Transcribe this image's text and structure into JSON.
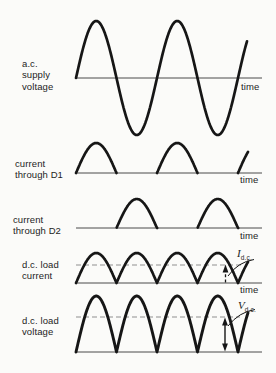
{
  "figure": {
    "colors": {
      "background": "#fbfbf9",
      "waveform": "#161616",
      "axis": "#4a4a4a",
      "dashed_line": "#8f8f8f",
      "text": "#1d1d1d"
    },
    "panels": [
      {
        "id": "ac-supply-voltage",
        "label_lines": [
          "a.c.",
          "supply",
          "voltage"
        ],
        "waveform": "sine",
        "time_label": "time"
      },
      {
        "id": "current-through-d1",
        "label_lines": [
          "current",
          "through D1"
        ],
        "waveform": "half-wave-rectified-positive-half-cycles",
        "time_label": "time"
      },
      {
        "id": "current-through-d2",
        "label_lines": [
          "current",
          "through D2"
        ],
        "waveform": "half-wave-rectified-negative-half-cycles",
        "time_label": "time"
      },
      {
        "id": "dc-load-current",
        "label_lines": [
          "d.c. load",
          "current"
        ],
        "waveform": "full-wave-rectified",
        "time_label": "time",
        "annotation": {
          "symbol": "I",
          "subscript": "d.c."
        }
      },
      {
        "id": "dc-load-voltage",
        "label_lines": [
          "d.c. load",
          "voltage"
        ],
        "waveform": "full-wave-rectified",
        "annotation": {
          "symbol": "V",
          "subscript": "d.c."
        }
      }
    ]
  }
}
